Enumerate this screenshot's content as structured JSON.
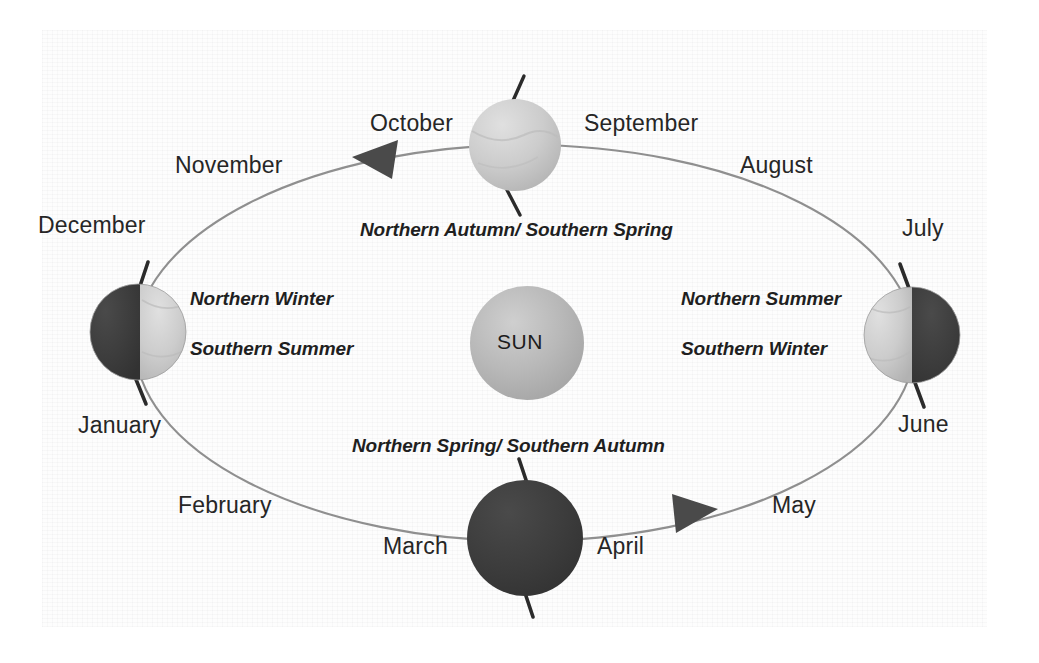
{
  "diagram": {
    "background_color": "#ffffff",
    "paper_color": "#fdfdfd"
  },
  "sun": {
    "label": "SUN",
    "center": {
      "x": 527,
      "y": 343
    },
    "radius": 57,
    "color": "#b4b4b4"
  },
  "orbit": {
    "center": {
      "x": 525,
      "y": 343
    },
    "rx": 390,
    "ry": 198,
    "stroke": "#8c8c8c",
    "direction": "counter-clockwise",
    "arrows": [
      {
        "name": "orbit-arrow-upper-left",
        "x": 352,
        "y": 157,
        "rotation": -155
      },
      {
        "name": "orbit-arrow-lower-right",
        "x": 710,
        "y": 511,
        "rotation": 22
      }
    ]
  },
  "earths": [
    {
      "id": "earth-september-october",
      "position_label": "top",
      "center": {
        "x": 515,
        "y": 145
      },
      "radius": 46,
      "lit_side": "none-shown-fully-lit",
      "light_color": "#c9c9c9",
      "dark_color": "#c9c9c9",
      "axis_tilt_deg": -12,
      "season": "Northern Autumn/ Southern Spring"
    },
    {
      "id": "earth-december-january",
      "position_label": "left",
      "center": {
        "x": 138,
        "y": 332
      },
      "radius": 48,
      "lit_side": "right",
      "light_color": "#cfcfcf",
      "dark_color": "#3c3c3c",
      "axis_tilt_deg": -10,
      "season_north": "Northern Winter",
      "season_south": "Southern Summer"
    },
    {
      "id": "earth-march-april",
      "position_label": "bottom",
      "center": {
        "x": 525,
        "y": 538
      },
      "radius": 58,
      "lit_side": "none-shown-fully-dark",
      "light_color": "#3a3a3a",
      "dark_color": "#3a3a3a",
      "axis_tilt_deg": -8,
      "season": "Northern Spring/ Southern Autumn"
    },
    {
      "id": "earth-june-july",
      "position_label": "right",
      "center": {
        "x": 912,
        "y": 335
      },
      "radius": 48,
      "lit_side": "left",
      "light_color": "#cfcfcf",
      "dark_color": "#3c3c3c",
      "axis_tilt_deg": -10,
      "season_north": "Northern Summer",
      "season_south": "Southern Winter"
    }
  ],
  "months": [
    {
      "name": "january",
      "label": "January",
      "x": 78,
      "y": 412
    },
    {
      "name": "february",
      "label": "February",
      "x": 178,
      "y": 492
    },
    {
      "name": "march",
      "label": "March",
      "x": 383,
      "y": 533
    },
    {
      "name": "april",
      "label": "April",
      "x": 597,
      "y": 533
    },
    {
      "name": "may",
      "label": "May",
      "x": 772,
      "y": 492
    },
    {
      "name": "june",
      "label": "June",
      "x": 898,
      "y": 411
    },
    {
      "name": "july",
      "label": "July",
      "x": 902,
      "y": 215
    },
    {
      "name": "august",
      "label": "August",
      "x": 740,
      "y": 152
    },
    {
      "name": "september",
      "label": "September",
      "x": 584,
      "y": 110
    },
    {
      "name": "october",
      "label": "October",
      "x": 370,
      "y": 110
    },
    {
      "name": "november",
      "label": "November",
      "x": 175,
      "y": 152
    },
    {
      "name": "december",
      "label": "December",
      "x": 38,
      "y": 212
    }
  ],
  "seasons": [
    {
      "name": "season-northern-autumn-southern-spring",
      "label": "Northern Autumn/ Southern Spring",
      "x": 360,
      "y": 219
    },
    {
      "name": "season-northern-winter",
      "label": "Northern Winter",
      "x": 190,
      "y": 288
    },
    {
      "name": "season-southern-summer",
      "label": "Southern Summer",
      "x": 190,
      "y": 338
    },
    {
      "name": "season-northern-summer",
      "label": "Northern Summer",
      "x": 681,
      "y": 288
    },
    {
      "name": "season-southern-winter",
      "label": "Southern Winter",
      "x": 681,
      "y": 338
    },
    {
      "name": "season-northern-spring-southern-autumn",
      "label": "Northern Spring/ Southern Autumn",
      "x": 352,
      "y": 435
    }
  ]
}
